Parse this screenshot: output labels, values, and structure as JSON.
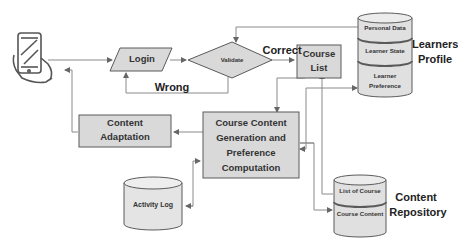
{
  "diagram": {
    "nodes": {
      "login": {
        "label": "Login",
        "shape": "parallelogram"
      },
      "validate": {
        "label": "Validate",
        "shape": "diamond"
      },
      "course_list": {
        "label_line1": "Course",
        "label_line2": "List",
        "shape": "rectangle"
      },
      "course_content_gen": {
        "line1": "Course Content",
        "line2": "Generation and",
        "line3": "Preference",
        "line4": "Computation",
        "shape": "rectangle"
      },
      "content_adaptation": {
        "line1": "Content",
        "line2": "Adaptation",
        "shape": "rectangle"
      },
      "activity_log": {
        "label": "Activity Log",
        "shape": "cylinder"
      },
      "learners_profile": {
        "title_line1": "Learners",
        "title_line2": "Profile",
        "sections": [
          "Personal Data",
          "Learner State",
          "Learner",
          "Preference"
        ],
        "shape": "cylinder"
      },
      "content_repository": {
        "title_line1": "Content",
        "title_line2": "Repository",
        "sections": [
          "List of Course",
          "Course Content"
        ],
        "shape": "cylinder"
      },
      "user_device": {
        "icon": "smartphone-hand-icon"
      }
    },
    "edge_labels": {
      "correct": "Correct",
      "wrong": "Wrong"
    },
    "colors": {
      "box_fill": "#d9d9d9",
      "box_stroke": "#5a5a5a",
      "line": "#7a7a7a",
      "cylinder_fill": "#e6e6e6",
      "text": "#2a2a2a"
    }
  }
}
